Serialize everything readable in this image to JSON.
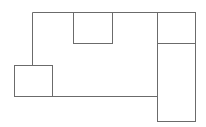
{
  "diagram": {
    "width": 206,
    "height": 127,
    "background": "#ffffff",
    "stroke_color": "#6b6b6b",
    "stroke_width": 1,
    "shapes": [
      {
        "id": "main-room",
        "type": "polyline",
        "points": [
          [
            32,
            65
          ],
          [
            32,
            12
          ],
          [
            157,
            12
          ],
          [
            157,
            96
          ],
          [
            52,
            96
          ]
        ]
      },
      {
        "id": "top-middle-box",
        "type": "rect",
        "x": 73,
        "y": 12,
        "w": 39,
        "h": 31
      },
      {
        "id": "left-box",
        "type": "rect",
        "x": 14,
        "y": 65,
        "w": 38,
        "h": 31
      },
      {
        "id": "right-top-box",
        "type": "rect",
        "x": 157,
        "y": 12,
        "w": 38,
        "h": 31
      },
      {
        "id": "right-bottom-box",
        "type": "rect",
        "x": 157,
        "y": 43,
        "w": 38,
        "h": 78
      }
    ]
  }
}
